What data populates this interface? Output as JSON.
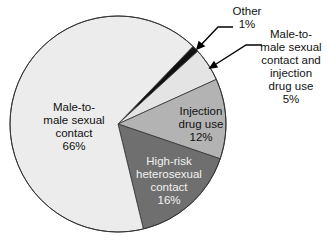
{
  "chart_data": {
    "type": "pie",
    "title": "",
    "start_angle_deg": 44,
    "direction": "clockwise",
    "slices": [
      {
        "label": "Other",
        "value": 1,
        "color": "#111111"
      },
      {
        "label": "Male-to-male sexual contact and injection drug use",
        "value": 5,
        "color": "#e4e4e4"
      },
      {
        "label": "Injection drug use",
        "value": 12,
        "color": "#b3b3b3"
      },
      {
        "label": "High-risk heterosexual contact",
        "value": 16,
        "color": "#6f6f6f"
      },
      {
        "label": "Male-to-male sexual contact",
        "value": 66,
        "color": "#ececec"
      }
    ]
  },
  "labels": {
    "other": "Other\n1%",
    "msm_idu": "Male-to-\nmale sexual\ncontact and\ninjection\ndrug use\n5%",
    "idu": "Injection\ndrug use\n12%",
    "het": "High-risk\nheterosexual\ncontact\n16%",
    "msm": "Male-to-\nmale sexual\ncontact\n66%"
  }
}
